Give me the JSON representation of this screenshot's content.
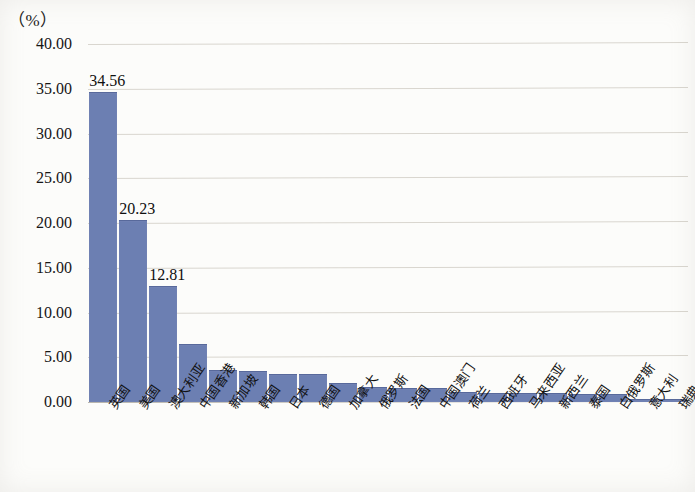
{
  "axis": {
    "unit_label": "（%）",
    "y_ticks": [
      "40.00",
      "35.00",
      "30.00",
      "25.00",
      "20.00",
      "15.00",
      "10.00",
      "5.00",
      "0.00"
    ]
  },
  "chart_data": {
    "type": "bar",
    "title": "",
    "xlabel": "",
    "ylabel": "（%）",
    "ylim": [
      0,
      40
    ],
    "ytick_step": 5,
    "grid": true,
    "legend": "none",
    "bar_color": "#6c7fb2",
    "categories": [
      "英国",
      "美国",
      "澳大利亚",
      "中国香港",
      "新加坡",
      "韩国",
      "日本",
      "德国",
      "加拿大",
      "俄罗斯",
      "法国",
      "中国澳门",
      "荷兰",
      "西班牙",
      "马来西亚",
      "新西兰",
      "泰国",
      "白俄罗斯",
      "意大利",
      "瑞典"
    ],
    "values": [
      34.56,
      20.23,
      12.81,
      6.4,
      3.45,
      3.4,
      3.05,
      3.0,
      2.05,
      1.6,
      1.5,
      1.45,
      1.0,
      0.95,
      0.9,
      0.85,
      0.8,
      0.8,
      0.25,
      0.2
    ],
    "labeled_values": [
      "34.56",
      "20.23",
      "12.81"
    ]
  }
}
